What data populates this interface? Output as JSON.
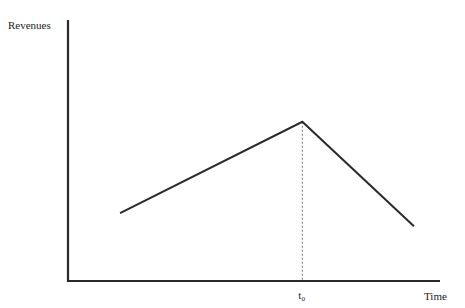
{
  "chart_data": {
    "type": "line",
    "title": "",
    "xlabel": "Time",
    "ylabel": "Revenues",
    "x_ticks": [
      {
        "label": "t",
        "subscript": "0",
        "x": 0.63
      }
    ],
    "xlim": [
      0,
      1
    ],
    "ylim": [
      0,
      1
    ],
    "grid": false,
    "legend": "none",
    "series": [
      {
        "name": "Revenues",
        "points": [
          {
            "x": 0.14,
            "y": 0.26
          },
          {
            "x": 0.63,
            "y": 0.61
          },
          {
            "x": 0.93,
            "y": 0.21
          }
        ]
      }
    ],
    "annotations": [
      {
        "type": "vertical-dashed-line",
        "x": 0.63,
        "from_y": 0,
        "to_y": 0.61
      }
    ]
  }
}
